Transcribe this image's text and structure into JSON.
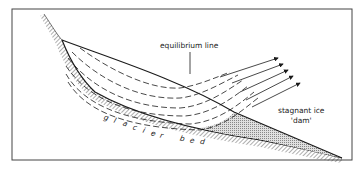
{
  "diagram": {
    "type": "glacier cross-section",
    "labels": {
      "equilibrium_line": "equilibrium line",
      "stagnant_ice_line1": "stagnant ice",
      "stagnant_ice_line2": "'dam'",
      "glacier_bed": "glacier bed"
    },
    "bed_letters": [
      "g",
      "l",
      "a",
      "c",
      "i",
      "e",
      "r",
      "b",
      "e",
      "d"
    ],
    "elements": [
      "frame",
      "valley-wall-hatching",
      "glacier-surface",
      "glacier-bed-line",
      "flow-lines",
      "flow-arrows",
      "stagnant-ice-zone",
      "equilibrium-line-marker"
    ],
    "colors": {
      "line": "#1a1a1a",
      "stagnant_fill": "#b8b8b8",
      "background": "#ffffff"
    }
  }
}
